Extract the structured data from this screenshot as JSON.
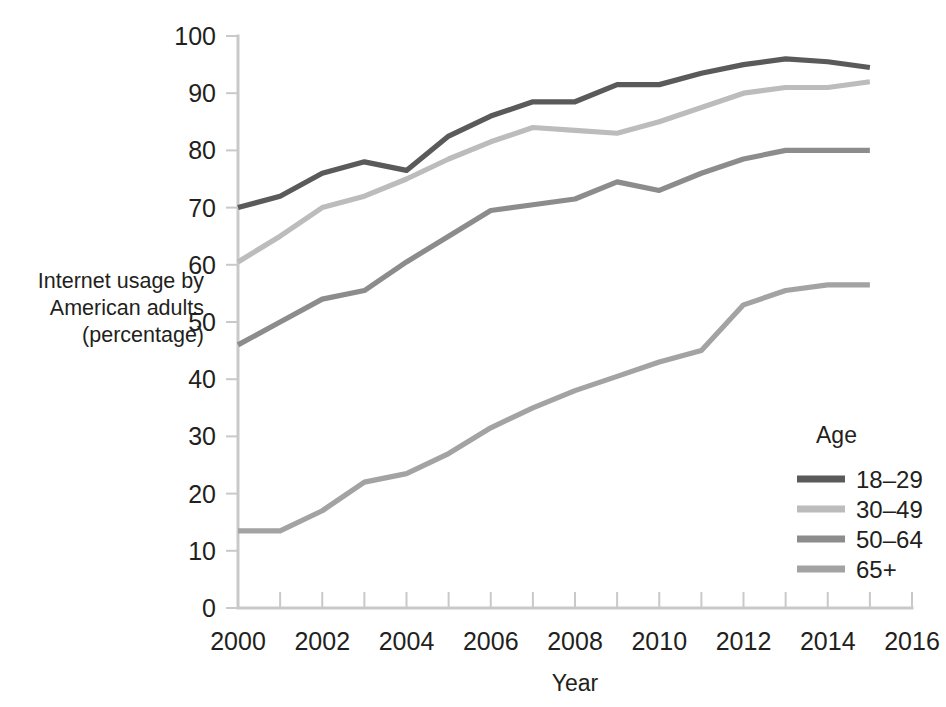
{
  "chart_data": {
    "type": "line",
    "title": "",
    "xlabel": "Year",
    "ylabel": "Internet usage by American adults (percentage)",
    "ylabel_lines": [
      "Internet usage by",
      "American adults",
      "(percentage)"
    ],
    "xlim": [
      2000,
      2016
    ],
    "ylim": [
      0,
      100
    ],
    "grid": false,
    "legend_position": "right-lower",
    "legend_title": "Age",
    "x_tick_labels": [
      "2000",
      "2002",
      "2004",
      "2006",
      "2008",
      "2010",
      "2012",
      "2014",
      "2016"
    ],
    "x_tick_values": [
      2000,
      2002,
      2004,
      2006,
      2008,
      2010,
      2012,
      2014,
      2016
    ],
    "x_minor_ticks": [
      2001,
      2003,
      2005,
      2007,
      2009,
      2011,
      2013,
      2015
    ],
    "y_tick_labels": [
      "0",
      "10",
      "20",
      "30",
      "40",
      "50",
      "60",
      "70",
      "80",
      "90",
      "100"
    ],
    "y_tick_values": [
      0,
      10,
      20,
      30,
      40,
      50,
      60,
      70,
      80,
      90,
      100
    ],
    "x": [
      2000,
      2001,
      2002,
      2003,
      2004,
      2005,
      2006,
      2007,
      2008,
      2009,
      2010,
      2011,
      2012,
      2013,
      2014,
      2015
    ],
    "series": [
      {
        "name": "18-29",
        "label": "18–29",
        "color": "#5a5a5a",
        "values": [
          70.0,
          72.0,
          76.0,
          78.0,
          76.5,
          82.5,
          86.0,
          88.5,
          88.5,
          91.5,
          91.5,
          93.5,
          95.0,
          96.0,
          95.5,
          94.5
        ]
      },
      {
        "name": "30-49",
        "label": "30–49",
        "color": "#bcbcbc",
        "values": [
          60.5,
          65.0,
          70.0,
          72.0,
          75.0,
          78.5,
          81.5,
          84.0,
          83.5,
          83.0,
          85.0,
          87.5,
          90.0,
          91.0,
          91.0,
          92.0
        ]
      },
      {
        "name": "50-64",
        "label": "50–64",
        "color": "#8c8c8c",
        "values": [
          46.0,
          50.0,
          54.0,
          55.5,
          60.5,
          65.0,
          69.5,
          70.5,
          71.5,
          74.5,
          73.0,
          76.0,
          78.5,
          80.0,
          80.0,
          80.0
        ]
      },
      {
        "name": "65+",
        "label": "65+",
        "color": "#a3a3a3",
        "values": [
          13.5,
          13.5,
          17.0,
          22.0,
          23.5,
          27.0,
          31.5,
          35.0,
          38.0,
          40.5,
          43.0,
          45.0,
          53.0,
          55.5,
          56.5,
          56.5
        ]
      }
    ]
  },
  "caption": {
    "text": ""
  }
}
